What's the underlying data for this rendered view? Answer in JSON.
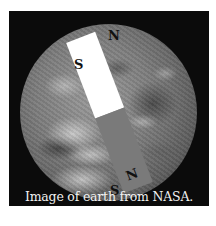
{
  "figure": {
    "caption": "Image of earth from NASA.",
    "colors": {
      "frame_background": "#0b0b0b",
      "magnet_south_half": "#ffffff",
      "magnet_north_half": "#7a7a7a",
      "caption_text": "#f2f2f2"
    },
    "magnet": {
      "top_half_label": "S",
      "bottom_half_label": "N"
    },
    "geographic_poles": {
      "north_label": "N",
      "south_label": "S"
    }
  }
}
